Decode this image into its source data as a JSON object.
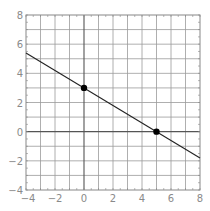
{
  "chart_data": {
    "type": "line",
    "title": "",
    "xlabel": "",
    "ylabel": "",
    "xlim": [
      -4,
      8
    ],
    "ylim": [
      -4,
      8
    ],
    "grid": true,
    "x_ticks": [
      -4,
      -2,
      0,
      2,
      4,
      6,
      8
    ],
    "y_ticks": [
      -4,
      -2,
      0,
      2,
      4,
      6,
      8
    ],
    "x_tick_labels": [
      "−4",
      "−2",
      "0",
      "2",
      "4",
      "6",
      "8"
    ],
    "y_tick_labels": [
      "−4",
      "−2",
      "0",
      "2",
      "4",
      "6",
      "8"
    ],
    "series": [
      {
        "name": "line",
        "equation": "y = -0.6x + 3",
        "x": [
          -4,
          8
        ],
        "y": [
          5.4,
          -1.8
        ],
        "color": "#222222"
      }
    ],
    "points": [
      {
        "x": 0,
        "y": 3,
        "label": "y-intercept"
      },
      {
        "x": 5,
        "y": 0,
        "label": "x-intercept"
      }
    ],
    "colors": {
      "grid": "#9a9a9a",
      "axis": "#555555",
      "border": "#888888",
      "line": "#222222",
      "point": "#000000",
      "label": "#8a8a8a"
    }
  },
  "layout": {
    "plot_left": 26,
    "plot_top": 15,
    "plot_right": 200,
    "plot_bottom": 190
  }
}
